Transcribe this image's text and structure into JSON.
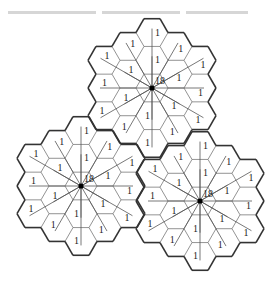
{
  "figure": {
    "type": "hexagonal-cell-clusters",
    "colors": {
      "outline": "#333333",
      "inner_edge": "#777777",
      "link": "#555555",
      "text": "#222222",
      "node": "#000000",
      "top_fragment": "#d6d6d6"
    },
    "clusters": [
      {
        "id": "top",
        "center_label": "18",
        "cell_label": "1",
        "cells": 19
      },
      {
        "id": "left",
        "center_label": "18",
        "cell_label": "1",
        "cells": 19
      },
      {
        "id": "right",
        "center_label": "18",
        "cell_label": "1",
        "cells": 19
      }
    ]
  }
}
